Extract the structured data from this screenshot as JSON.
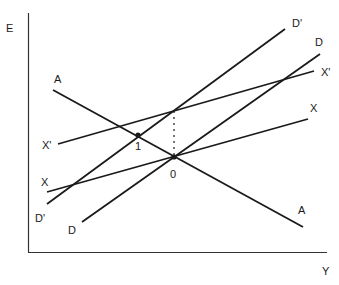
{
  "colors": {
    "ink": "#1a1a1a",
    "axis": "#333333",
    "background": "#ffffff"
  },
  "axes": {
    "y_label": "E",
    "x_label": "Y"
  },
  "curves": [
    {
      "id": "A",
      "start_label": "A",
      "end_label": "A",
      "x1": 53,
      "y1": 90,
      "x2": 303,
      "y2": 227
    },
    {
      "id": "X",
      "start_label": "X",
      "end_label": "X",
      "x1": 47,
      "y1": 192,
      "x2": 308,
      "y2": 119
    },
    {
      "id": "X'",
      "start_label": "X'",
      "end_label": "X'",
      "x1": 58,
      "y1": 144,
      "x2": 314,
      "y2": 71
    },
    {
      "id": "D",
      "start_label": "D",
      "end_label": "D",
      "x1": 82,
      "y1": 222,
      "x2": 320,
      "y2": 54
    },
    {
      "id": "D'",
      "start_label": "D'",
      "end_label": "D'",
      "x1": 47,
      "y1": 204,
      "x2": 285,
      "y2": 29
    }
  ],
  "points": [
    {
      "label": "0",
      "x": 174,
      "y": 157
    },
    {
      "label": "1",
      "x": 138,
      "y": 135
    }
  ],
  "labels": {
    "E": "E",
    "Y": "Y",
    "A_left": "A",
    "A_right": "A",
    "X_left": "X",
    "X_right": "X",
    "Xp_left": "X'",
    "Xp_right": "X'",
    "D_left": "D",
    "D_right": "D",
    "Dp_left": "D'",
    "Dp_right": "D'",
    "point_0": "0",
    "point_1": "1"
  }
}
